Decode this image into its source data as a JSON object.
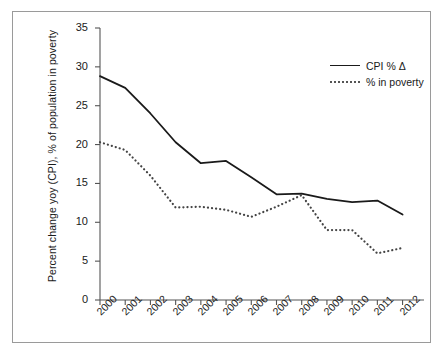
{
  "chart_data": {
    "type": "line",
    "title": "",
    "xlabel": "",
    "ylabel": "Percent change yoy (CPI), % of population in poverty",
    "x": [
      "2000",
      "2001",
      "2002",
      "2003",
      "2004",
      "2005",
      "2006",
      "2007",
      "2008",
      "2009",
      "2010",
      "2011",
      "2012"
    ],
    "xlim": [
      2000,
      2012
    ],
    "ylim": [
      0,
      35
    ],
    "yticks": [
      "0",
      "5",
      "10",
      "15",
      "20",
      "25",
      "30",
      "35"
    ],
    "ytick_values": [
      0,
      5,
      10,
      15,
      20,
      25,
      30,
      35
    ],
    "grid": false,
    "legend_position": "top-right",
    "series": [
      {
        "name": "CPI % Δ",
        "style": "solid",
        "color": "#1a1a1a",
        "values": [
          28.8,
          27.3,
          24.0,
          20.3,
          17.6,
          17.9,
          15.8,
          13.6,
          13.7,
          13.0,
          12.6,
          12.8,
          11.0
        ]
      },
      {
        "name": "% in poverty",
        "style": "dotted",
        "color": "#444444",
        "values": [
          20.3,
          19.3,
          16.0,
          11.9,
          12.0,
          11.6,
          10.7,
          12.0,
          13.5,
          9.0,
          9.0,
          6.0,
          6.7
        ]
      }
    ]
  },
  "axes": {
    "y_title": "Percent change yoy (CPI), % of population in poverty",
    "x_title": ""
  },
  "legend": {
    "entries": [
      {
        "label": "CPI % Δ",
        "sample": "solid-line-swatch"
      },
      {
        "label": "% in poverty",
        "sample": "dotted-line-swatch"
      }
    ]
  }
}
